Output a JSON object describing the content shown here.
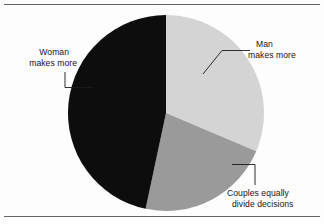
{
  "figure": {
    "name": "household-earnings-pie-chart",
    "background_color": "#fdfdfd",
    "top_rule_color": "#636363",
    "bottom_rule_color": "#636363"
  },
  "chart_data": {
    "type": "pie",
    "title": "",
    "subtitle": "",
    "xlabel": "",
    "ylabel": "",
    "grid": false,
    "legend_position": "none",
    "label_style": "leader-line callouts",
    "start_angle_deg": 0,
    "direction": "clockwise",
    "center": {
      "x": 166,
      "y": 113
    },
    "radius": 98,
    "categories": [
      "Man makes more",
      "Couples equally divide decisions",
      "Woman makes more"
    ],
    "values": [
      31,
      22,
      47
    ],
    "value_unit": "percent",
    "slices": [
      {
        "label_line1": "Man",
        "label_line2": "makes more",
        "label_full": "Man makes more",
        "value": 31,
        "start_deg": 0,
        "end_deg": 113,
        "color": "#d4d4d4"
      },
      {
        "label_line1": "Couples equally",
        "label_line2": "divide decisions",
        "label_full": "Couples equally divide decisions",
        "value": 22,
        "start_deg": 113,
        "end_deg": 192,
        "color": "#9a9a9a"
      },
      {
        "label_line1": "Woman",
        "label_line2": "makes more",
        "label_full": "Woman makes more",
        "value": 47,
        "start_deg": 192,
        "end_deg": 360,
        "color": "#0d0d0d"
      }
    ]
  },
  "labels": {
    "man_line1": "Man",
    "man_line2": "makes more",
    "couples_line1": "Couples equally",
    "couples_line2": "divide decisions",
    "woman_line1": "Woman",
    "woman_line2": "makes more"
  }
}
